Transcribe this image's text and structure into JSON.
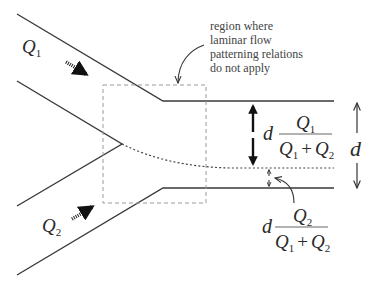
{
  "diagram": {
    "type": "laminar-flow-junction",
    "inlets": [
      {
        "label": "Q",
        "subscript": "1",
        "position": "upper-left"
      },
      {
        "label": "Q",
        "subscript": "2",
        "position": "lower-left"
      }
    ],
    "annotation": {
      "lines": [
        "region where",
        "laminar flow",
        "patterning relations",
        "do not apply"
      ]
    },
    "channel_width_label": "d",
    "stream1_width": {
      "prefix": "d",
      "numerator": {
        "q": "Q",
        "sub": "1"
      },
      "denominator": {
        "q1": "Q",
        "sub1": "1",
        "plus": "+",
        "q2": "Q",
        "sub2": "2"
      }
    },
    "stream2_width": {
      "prefix": "d",
      "numerator": {
        "q": "Q",
        "sub": "2"
      },
      "denominator": {
        "q1": "Q",
        "sub1": "1",
        "plus": "+",
        "q2": "Q",
        "sub2": "2"
      }
    },
    "colors": {
      "line": "#3a3a3a",
      "dashed_box": "#9a9a9a",
      "text": "#2a2a2a"
    }
  }
}
